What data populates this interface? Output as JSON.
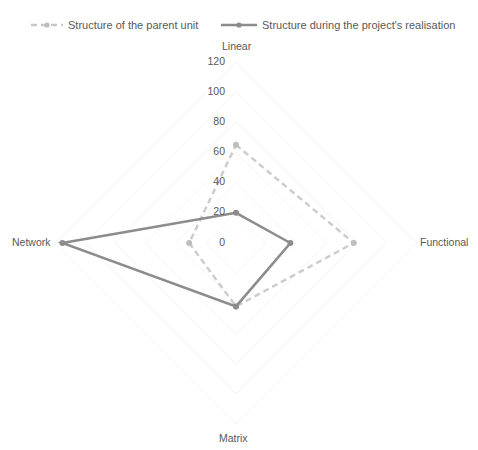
{
  "chart_data": {
    "type": "radar",
    "title": "",
    "axes": [
      "Linear",
      "Functional",
      "Matrix",
      "Network"
    ],
    "radial_ticks": [
      "0",
      "20",
      "40",
      "60",
      "80",
      "100",
      "120"
    ],
    "rlim": [
      0,
      120
    ],
    "grid": true,
    "legend_position": "top",
    "series": [
      {
        "name": "Structure of the parent unit",
        "style": "dashed",
        "color": "#c8c8c8",
        "values": [
          65,
          78,
          42,
          31
        ]
      },
      {
        "name": "Structure during the project's realisation",
        "style": "solid",
        "color": "#8c8c8c",
        "values": [
          20,
          36,
          42,
          115
        ]
      }
    ]
  },
  "legend": {
    "series1_label": "Structure of the parent unit",
    "series2_label": "Structure during the project's realisation"
  },
  "axes_labels": {
    "linear": "Linear",
    "functional": "Functional",
    "matrix": "Matrix",
    "network": "Network"
  },
  "ticks": {
    "t0": "0",
    "t20": "20",
    "t40": "40",
    "t60": "60",
    "t80": "80",
    "t100": "100",
    "t120": "120"
  }
}
